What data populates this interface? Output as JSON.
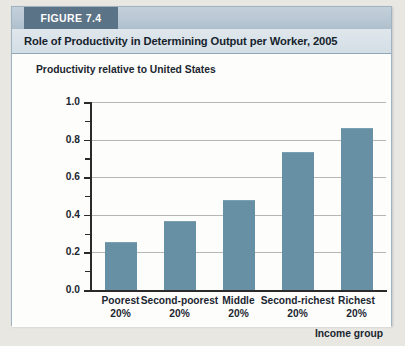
{
  "figure": {
    "tag_label": "FIGURE 7.4",
    "title": "Role of Productivity in Determining Output per Worker, 2005",
    "tag_bg_color": "#5b7386",
    "header_bg_color": "#c3d0da",
    "card_border_color": "#9fb3c2"
  },
  "chart_data": {
    "type": "bar",
    "title": "Role of Productivity in Determining Output per Worker, 2005",
    "categories": [
      "Poorest 20%",
      "Second-poorest 20%",
      "Middle 20%",
      "Second-richest 20%",
      "Richest 20%"
    ],
    "category_lines": [
      {
        "name": "Poorest",
        "pct": "20%"
      },
      {
        "name": "Second-poorest",
        "pct": "20%"
      },
      {
        "name": "Middle",
        "pct": "20%"
      },
      {
        "name": "Second-richest",
        "pct": "20%"
      },
      {
        "name": "Richest",
        "pct": "20%"
      }
    ],
    "values": [
      0.25,
      0.36,
      0.475,
      0.73,
      0.855
    ],
    "xlabel": "Income group",
    "ylabel": "Productivity relative to United States",
    "ylim": [
      0.0,
      1.0
    ],
    "ytick_labels": [
      "1.0",
      "0.8",
      "0.6",
      "0.4",
      "0.2",
      "0.0"
    ],
    "ytick_values": [
      1.0,
      0.8,
      0.6,
      0.4,
      0.2,
      0.0
    ],
    "yminor_values": [
      0.9,
      0.7,
      0.5,
      0.3,
      0.1
    ],
    "grid": true,
    "grid_color": "#b6b6b6",
    "legend": null,
    "bar_color": "#6790a5",
    "axis_color": "#2a2a2a",
    "plot_background": "#fdfdfc"
  }
}
